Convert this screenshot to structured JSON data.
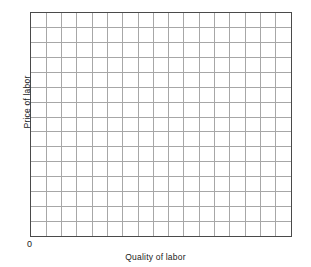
{
  "chart_data": {
    "type": "line",
    "title": "",
    "subtitle": "",
    "xlabel": "Quality of labor",
    "ylabel": "Price of labor",
    "origin_label": "0",
    "series": [],
    "categories": [],
    "values": [],
    "x": [],
    "xlim": [
      0,
      17
    ],
    "ylim": [
      0,
      15
    ],
    "xtick_labels": [],
    "ytick_labels": [],
    "grid": true,
    "grid_columns": 17,
    "grid_rows": 15,
    "legend": false,
    "legend_position": "none",
    "annotations": []
  },
  "style": {
    "background_color": "#ffffff",
    "border_color": "#4a4a4a",
    "grid_line_color": "#a6a6a6",
    "text_color": "#1a1a1a"
  }
}
